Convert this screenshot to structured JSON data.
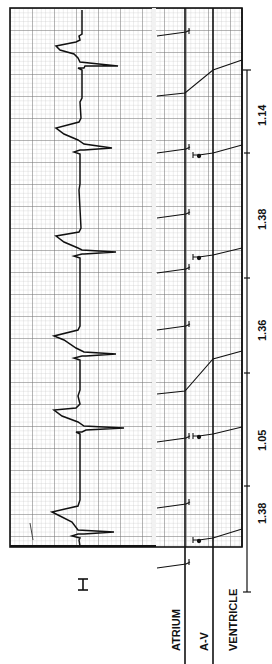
{
  "figure": {
    "lead_label": "I",
    "ladder_rows": [
      "ATRIUM",
      "A-V",
      "VENTRICLE"
    ],
    "intervals": [
      {
        "label": "1.38",
        "y_from": 592,
        "y_to": 418
      },
      {
        "label": "1.05",
        "y_from": 486,
        "y_to": 373
      },
      {
        "label": "1.36",
        "y_from": 373,
        "y_to": 278
      },
      {
        "label": "1.38",
        "y_from": 278,
        "y_to": 153
      },
      {
        "label": "1.14",
        "y_from": 153,
        "y_to": 70
      }
    ],
    "colors": {
      "grid_minor": "#c8c8c8",
      "grid_major": "#6a6a6a",
      "ink": "#111111",
      "paper": "#f4f4f4"
    }
  }
}
